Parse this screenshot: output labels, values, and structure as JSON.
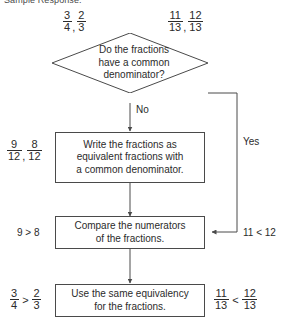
{
  "header": {
    "text": "Sample Response:"
  },
  "flowchart": {
    "decision": {
      "text": "Do the fractions have a common denominator?",
      "line1": "Do the fractions",
      "line2": "have a common",
      "line3": "denominator?"
    },
    "process_1": {
      "line1": "Write the fractions as",
      "line2": "equivalent fractions with",
      "line3": "a common denominator."
    },
    "process_2": {
      "line1": "Compare the numerators",
      "line2": "of the fractions."
    },
    "process_3": {
      "line1": "Use the same equivalency",
      "line2": "for the fractions."
    },
    "branch_no": "No",
    "branch_yes": "Yes"
  },
  "examples": {
    "left": {
      "input": {
        "f1_num": "3",
        "f1_den": "4",
        "sep": ",",
        "f2_num": "2",
        "f2_den": "3"
      },
      "equivalent": {
        "f1_num": "9",
        "f1_den": "12",
        "sep": ",",
        "f2_num": "8",
        "f2_den": "12"
      },
      "numerator_compare": "9 > 8",
      "result": {
        "f1_num": "3",
        "f1_den": "4",
        "rel": ">",
        "f2_num": "2",
        "f2_den": "3"
      }
    },
    "right": {
      "input": {
        "f1_num": "11",
        "f1_den": "13",
        "sep": ",",
        "f2_num": "12",
        "f2_den": "13"
      },
      "numerator_compare": "11 < 12",
      "result": {
        "f1_num": "11",
        "f1_den": "13",
        "rel": "<",
        "f2_num": "12",
        "f2_den": "13"
      }
    }
  },
  "colors": {
    "stroke": "#4a4a4a",
    "text": "#2b2b2b",
    "background": "#ffffff"
  }
}
